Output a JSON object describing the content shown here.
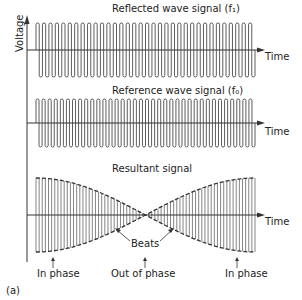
{
  "figure": {
    "panel_label": "(a)",
    "y_axis_label": "Voltage",
    "x_axis_label": "Time",
    "colors": {
      "line": "#333333",
      "background": "#ffffff"
    }
  },
  "panels": [
    {
      "title": "Reflected wave signal  (f₁)",
      "x_label": "Time",
      "cycles": 34,
      "amplitude": 27
    },
    {
      "title": "Reference wave signal  (f₀)",
      "x_label": "Time",
      "cycles": 36,
      "amplitude": 24
    },
    {
      "title": "Resultant signal",
      "x_label": "Time",
      "cycles": 35,
      "envelope": "beats"
    }
  ],
  "annotations": {
    "beats": "Beats",
    "in_phase_left": "In phase",
    "out_of_phase": "Out of phase",
    "in_phase_right": "In phase"
  }
}
